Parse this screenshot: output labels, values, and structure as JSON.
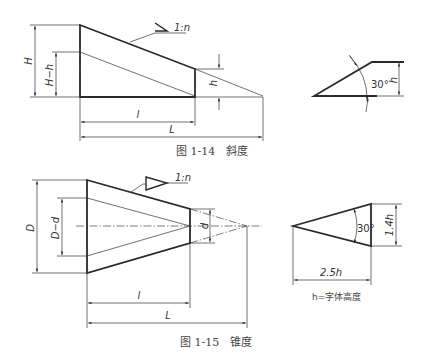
{
  "figures": [
    {
      "id": "fig-1-14",
      "caption": "图 1-14　斜度",
      "symbol_label": "1:n",
      "dimensions": {
        "H": "H",
        "H_minus_h": "H−h",
        "h": "h",
        "l": "l",
        "L": "L"
      }
    },
    {
      "id": "fig-1-15",
      "caption": "图 1-15　锥度",
      "symbol_label": "1:n",
      "dimensions": {
        "D": "D",
        "D_minus_d": "D−d",
        "d": "d",
        "l": "l",
        "L": "L"
      }
    }
  ],
  "slope_symbol_detail": {
    "angle": "30°",
    "height": "h"
  },
  "taper_symbol_detail": {
    "angle": "30°",
    "height": "1.4h",
    "width": "2.5h",
    "note": "h=字体高度"
  }
}
